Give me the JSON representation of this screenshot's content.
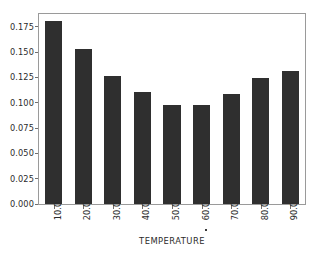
{
  "chart_data": {
    "type": "bar",
    "title": "",
    "subtitle": "",
    "xlabel": "TEMPERATURE",
    "ylabel": "",
    "categories": [
      "10.0",
      "20.0",
      "30.0",
      "40.0",
      "50.0",
      "60.0",
      "70.0",
      "80.0",
      "90.0"
    ],
    "values": [
      0.181,
      0.153,
      0.126,
      0.111,
      0.098,
      0.098,
      0.109,
      0.124,
      0.131
    ],
    "ylim": [
      0.0,
      0.1875
    ],
    "xlim": [
      0,
      9
    ],
    "yticks": [
      0.0,
      0.025,
      0.05,
      0.075,
      0.1,
      0.125,
      0.15,
      0.175
    ],
    "ytick_labels": [
      "0.000",
      "0.025",
      "0.050",
      "0.075",
      "0.100",
      "0.125",
      "0.150",
      "0.175"
    ],
    "xtick_labels": [
      "10.0",
      "20.0",
      "30.0",
      "40.0",
      "50.0",
      "60.0",
      "70.0",
      "80.0",
      "90.0"
    ],
    "xtick_label_rotation": -90,
    "grid": false,
    "legend": null,
    "legend_position": "none",
    "bar_color": "#2f2f2f",
    "axis_color": "#9a9a9a",
    "background_color": "#ffffff",
    "annotations": [
      {
        "near": "60.0",
        "text": "·",
        "kind": "render-artifact-dot"
      }
    ]
  }
}
